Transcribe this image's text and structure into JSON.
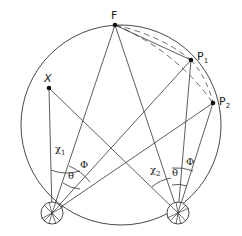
{
  "diagram": {
    "type": "geometry-scattering-diagram",
    "circle": {
      "cx": 121,
      "cy": 125,
      "r": 100
    },
    "points": {
      "F": {
        "label": "F",
        "x": 115,
        "y": 25
      },
      "P1": {
        "label": "P",
        "sub": "1",
        "x": 191,
        "y": 60
      },
      "P2": {
        "label": "P",
        "sub": "2",
        "x": 213,
        "y": 103
      },
      "X": {
        "label": "X",
        "x": 49,
        "y": 88
      }
    },
    "detectors": [
      {
        "name": "detector-1",
        "x": 52,
        "y": 213,
        "r": 11
      },
      {
        "name": "detector-2",
        "x": 178,
        "y": 213,
        "r": 11
      }
    ],
    "angles": {
      "chi1": {
        "label": "χ",
        "sub": "1"
      },
      "chi2": {
        "label": "χ",
        "sub": "2"
      },
      "theta1": {
        "label": "θ"
      },
      "phi1": {
        "label": "Φ"
      },
      "theta2": {
        "label": "θ"
      },
      "phi2": {
        "label": "Φ"
      }
    },
    "stroke_color": "#333333",
    "background": "#ffffff"
  }
}
